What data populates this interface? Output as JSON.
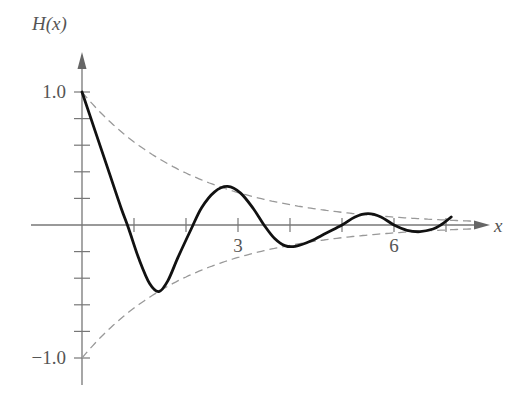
{
  "chart_data": {
    "type": "line",
    "title": "",
    "xlabel": "x",
    "ylabel": "H(x)",
    "xlim": [
      0,
      7.7
    ],
    "ylim": [
      -1.0,
      1.0
    ],
    "x_ticks": [
      1,
      2,
      3,
      4,
      5,
      6,
      7
    ],
    "x_tick_labels": [
      {
        "value": 3,
        "label": "3"
      },
      {
        "value": 6,
        "label": "6"
      }
    ],
    "y_ticks": [
      -1.0,
      -0.8,
      -0.6,
      -0.4,
      -0.2,
      0.2,
      0.4,
      0.6,
      0.8,
      1.0
    ],
    "y_tick_labels": [
      {
        "value": 1.0,
        "label": "1.0"
      },
      {
        "value": -1.0,
        "label": "−1.0"
      }
    ],
    "grid": false,
    "legend": null,
    "series": [
      {
        "name": "H(x)",
        "style": "solid",
        "color": "#111111",
        "points": [
          [
            0.0,
            1.0
          ],
          [
            0.25,
            0.71
          ],
          [
            0.5,
            0.42
          ],
          [
            0.75,
            0.13
          ],
          [
            0.9,
            -0.03
          ],
          [
            1.1,
            -0.26
          ],
          [
            1.3,
            -0.44
          ],
          [
            1.48,
            -0.5
          ],
          [
            1.65,
            -0.42
          ],
          [
            1.85,
            -0.24
          ],
          [
            2.1,
            -0.03
          ],
          [
            2.3,
            0.13
          ],
          [
            2.55,
            0.25
          ],
          [
            2.8,
            0.29
          ],
          [
            3.05,
            0.24
          ],
          [
            3.3,
            0.12
          ],
          [
            3.5,
            0.0
          ],
          [
            3.7,
            -0.1
          ],
          [
            3.9,
            -0.155
          ],
          [
            4.1,
            -0.16
          ],
          [
            4.4,
            -0.12
          ],
          [
            4.7,
            -0.06
          ],
          [
            5.0,
            0.0
          ],
          [
            5.25,
            0.06
          ],
          [
            5.5,
            0.085
          ],
          [
            5.75,
            0.06
          ],
          [
            6.0,
            0.0
          ],
          [
            6.25,
            -0.04
          ],
          [
            6.5,
            -0.05
          ],
          [
            6.75,
            -0.03
          ],
          [
            6.9,
            0.0
          ],
          [
            7.1,
            0.06
          ]
        ]
      },
      {
        "name": "upper envelope",
        "style": "dashed",
        "color": "#999999",
        "function": "exp(-0.47x)",
        "x_range": [
          0,
          7.5
        ]
      },
      {
        "name": "lower envelope",
        "style": "dashed",
        "color": "#999999",
        "function": "-exp(-0.47x)",
        "x_range": [
          0,
          7.5
        ]
      }
    ]
  },
  "labels": {
    "y_axis": "H(x)",
    "x_axis": "x",
    "y_top": "1.0",
    "y_bottom": "−1.0",
    "x_3": "3",
    "x_6": "6"
  }
}
